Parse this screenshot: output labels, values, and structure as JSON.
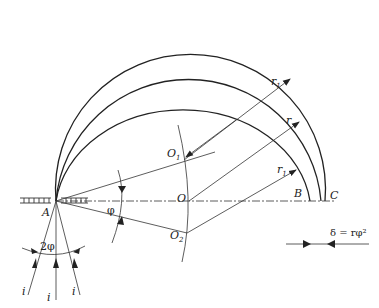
{
  "diagram": {
    "type": "geometric-optics-focusing-circles",
    "colors": {
      "line": "#222222",
      "background": "#ffffff"
    },
    "points": {
      "A": {
        "label": "A",
        "x": 56,
        "y": 201
      },
      "O": {
        "label": "O",
        "x": 189,
        "y": 201
      },
      "O1": {
        "label": "O",
        "sub": "1",
        "x": 185,
        "y": 158
      },
      "O2": {
        "label": "O",
        "sub": "2",
        "x": 187,
        "y": 233
      },
      "B": {
        "label": "B",
        "x": 310,
        "y": 201
      },
      "C": {
        "label": "C",
        "x": 325,
        "y": 201
      }
    },
    "radius_labels": {
      "outer": {
        "label": "r",
        "sub": "1"
      },
      "middle": {
        "label": "r",
        "sub": ""
      },
      "inner": {
        "label": "r",
        "sub": "1"
      }
    },
    "angle_labels": {
      "phi": "φ",
      "two_phi": "2φ"
    },
    "ray_labels": [
      "i",
      "i",
      "i"
    ],
    "formula": "δ = rφ²"
  }
}
